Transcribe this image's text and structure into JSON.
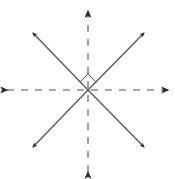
{
  "figure": {
    "canvas": {
      "width": 175,
      "height": 179,
      "background": "#ffffff"
    },
    "center": {
      "x": 88,
      "y": 90
    },
    "colors": {
      "dashed_axis": "#8a8a8a",
      "solid_ray": "#55555a",
      "marker": "#55555a",
      "arrowhead": "#2b2b2b"
    },
    "stroke": {
      "dashed_width": 1.6,
      "solid_width": 1.3,
      "marker_width": 1.0,
      "dash_pattern": "7 7"
    },
    "axes": [
      {
        "name": "vertical-axis",
        "style": "dashed",
        "from": {
          "x": 88,
          "y": 172
        },
        "to": {
          "x": 88,
          "y": 11
        },
        "arrowheads": "both",
        "label": ""
      },
      {
        "name": "horizontal-axis",
        "style": "dashed",
        "from": {
          "x": 7,
          "y": 90
        },
        "to": {
          "x": 168,
          "y": 90
        },
        "arrowheads": "both",
        "label": ""
      }
    ],
    "rays": [
      {
        "name": "ray-upper-left",
        "style": "solid",
        "from": {
          "x": 88,
          "y": 90
        },
        "to": {
          "x": 33,
          "y": 33
        },
        "arrowhead": "end",
        "label": ""
      },
      {
        "name": "ray-upper-right",
        "style": "solid",
        "from": {
          "x": 88,
          "y": 90
        },
        "to": {
          "x": 144,
          "y": 33
        },
        "arrowhead": "end",
        "label": ""
      },
      {
        "name": "ray-lower-left",
        "style": "solid",
        "from": {
          "x": 88,
          "y": 90
        },
        "to": {
          "x": 33,
          "y": 147
        },
        "arrowhead": "end",
        "label": ""
      },
      {
        "name": "ray-lower-right",
        "style": "solid",
        "from": {
          "x": 88,
          "y": 90
        },
        "to": {
          "x": 144,
          "y": 147
        },
        "arrowhead": "end",
        "label": ""
      }
    ],
    "right_angle_marker": {
      "name": "right-angle-marker",
      "shape": "square-rotated-45",
      "points": "88,74 96,82 88,90 80,82",
      "label": ""
    },
    "annotations": []
  }
}
